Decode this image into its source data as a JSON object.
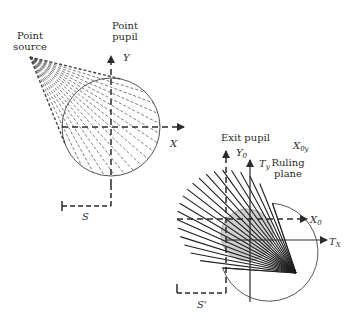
{
  "diagram": {
    "colors": {
      "ink": "#2b2b2b",
      "dashed_ray": "#555555",
      "gray_circle": "#c8c8c8",
      "background": "#ffffff"
    },
    "left_panel": {
      "source_label_line1": "Point",
      "source_label_line2": "source",
      "pupil_label_line1": "Point",
      "pupil_label_line2": "pupil",
      "y_axis_label": "Y",
      "x_axis_label": "X",
      "distance_label": "S"
    },
    "right_panel": {
      "exit_pupil_label": "Exit pupil",
      "y0_label": "Y",
      "y0_sub": "0",
      "ty_label": "T",
      "ty_sub": "y",
      "x0y_label": "X",
      "x0y_sub": "0y",
      "ruling_plane_line1": "Ruling",
      "ruling_plane_line2": "plane",
      "x0_label": "X",
      "x0_sub": "0",
      "tx_label": "T",
      "tx_sub": "X",
      "distance_label": "S'"
    }
  }
}
